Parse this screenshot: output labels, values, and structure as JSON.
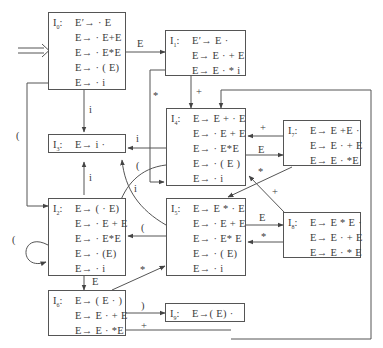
{
  "diagram": {
    "type": "LR(0) item-set automaton",
    "states": [
      {
        "id": "I0",
        "label": "I",
        "sub": "0",
        "items": [
          "E′→ · E",
          "E→ · E+E",
          "E→ · E*E",
          "E→ · ( E)",
          "E→ · i"
        ]
      },
      {
        "id": "I1",
        "label": "I",
        "sub": "1",
        "items": [
          "E′→ E ·",
          "E→ E · + E",
          "E→ E · * i"
        ]
      },
      {
        "id": "I3",
        "label": "I",
        "sub": "3",
        "items": [
          "E→ i ·"
        ]
      },
      {
        "id": "I4",
        "label": "I",
        "sub": "4",
        "items": [
          "E→ E + · E",
          "E→ · E + E",
          "E→ · E*E",
          "E→ · ( E )",
          "E→ · i"
        ]
      },
      {
        "id": "I7",
        "label": "I",
        "sub": "7",
        "items": [
          "E→ E +E ·",
          "E→ E · + E",
          "E→ E · *E"
        ]
      },
      {
        "id": "I2",
        "label": "I",
        "sub": "2",
        "items": [
          "E→ ( · E)",
          "E→ · E + E",
          "E→ · E*E",
          "E→ · (E)",
          "E→ · i"
        ]
      },
      {
        "id": "I5",
        "label": "I",
        "sub": "5",
        "items": [
          "E→ E * · E",
          "E→ · E + E",
          "E→ · E* E",
          "E→ · ( E)",
          "E→ · i"
        ]
      },
      {
        "id": "I8",
        "label": "I",
        "sub": "8",
        "items": [
          "E→ E * E ·",
          "E→ E · + E",
          "E→ E · * E"
        ]
      },
      {
        "id": "I6",
        "label": "I",
        "sub": "6",
        "items": [
          "E→ ( E · )",
          "E→ E · + E",
          "E→ E · *E"
        ]
      },
      {
        "id": "I9",
        "label": "I",
        "sub": "9",
        "items": [
          "E→( E) ·"
        ]
      }
    ],
    "start_arrow": "⟹",
    "edge_labels": {
      "I0_I1": "E",
      "I0_I3": "i",
      "I0_I2": "(",
      "I1_I4": "+",
      "I1_I5": "*",
      "I4_I3": "i",
      "I4_I2": "(",
      "I4_I7": "E",
      "I7_I4": "+",
      "I7_I5": "*",
      "I2_I3": "i",
      "I2_I2": "(",
      "I2_I6": "E",
      "I5_I3": "i",
      "I5_I2": "(",
      "I5_I8": "E",
      "I8_I5": "*",
      "I8_I4": "+",
      "I6_I9": ")",
      "I6_I4": "+",
      "I6_I5": "*"
    }
  }
}
